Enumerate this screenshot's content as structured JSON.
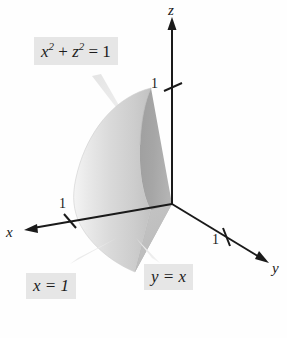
{
  "figure": {
    "kind": "3d-solid-diagram",
    "background": "#ffffff"
  },
  "axes": [
    {
      "name": "x",
      "label": "x",
      "tick_label": "1"
    },
    {
      "name": "y",
      "label": "y",
      "tick_label": "1"
    },
    {
      "name": "z",
      "label": "z",
      "tick_label": "1"
    }
  ],
  "callouts": [
    {
      "name": "cylinder",
      "base": "x",
      "sup1": "2",
      "plus": "+",
      "base2": "z",
      "sup2": "2",
      "equals": "= 1",
      "text": "x2 + z2 = 1"
    },
    {
      "name": "plane-x",
      "text": "x = 1"
    },
    {
      "name": "plane-yx",
      "text": "y = x"
    }
  ],
  "colors": {
    "axis": "#1a1a1a",
    "label_box": "#e6e6e6",
    "text": "#1c1c1c",
    "surface_light": "#efefef",
    "surface_mid": "#d2d2d2",
    "surface_dark": "#a8a8a8",
    "cut_plane": "#9a9a9a",
    "leader": "#e3e3e3"
  }
}
